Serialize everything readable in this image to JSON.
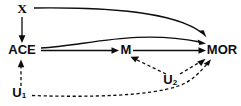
{
  "diagram": {
    "type": "causal-dag",
    "title": "",
    "colors": {
      "background": "#ffffff",
      "ink": "#0d0d0d"
    },
    "nodes": [
      {
        "id": "X",
        "label": "X",
        "subscript": "",
        "x": 22,
        "y": 10,
        "style": "serif-bold"
      },
      {
        "id": "ACE",
        "label": "ACE",
        "subscript": "",
        "x": 22,
        "y": 50,
        "style": "bold"
      },
      {
        "id": "M",
        "label": "M",
        "subscript": "",
        "x": 126,
        "y": 50,
        "style": "bold"
      },
      {
        "id": "MOR",
        "label": "MOR",
        "subscript": "",
        "x": 222,
        "y": 50,
        "style": "bold"
      },
      {
        "id": "U1",
        "label": "U",
        "subscript": "1",
        "x": 20,
        "y": 94,
        "style": "bold"
      },
      {
        "id": "U2",
        "label": "U",
        "subscript": "2",
        "x": 171,
        "y": 81,
        "style": "bold"
      }
    ],
    "edges": [
      {
        "id": "x-to-mor",
        "from": "X",
        "to": "MOR",
        "line": "solid",
        "shape": "curved"
      },
      {
        "id": "x-to-ace",
        "from": "X",
        "to": "ACE",
        "line": "solid",
        "shape": "straight"
      },
      {
        "id": "ace-to-mor",
        "from": "ACE",
        "to": "MOR",
        "line": "solid",
        "shape": "curved"
      },
      {
        "id": "ace-to-m",
        "from": "ACE",
        "to": "M",
        "line": "solid",
        "shape": "straight"
      },
      {
        "id": "m-to-mor",
        "from": "M",
        "to": "MOR",
        "line": "solid",
        "shape": "straight"
      },
      {
        "id": "u2-to-m",
        "from": "U2",
        "to": "M",
        "line": "dashed",
        "shape": "straight"
      },
      {
        "id": "u2-to-mor",
        "from": "U2",
        "to": "MOR",
        "line": "dashed",
        "shape": "straight"
      },
      {
        "id": "u1-to-ace",
        "from": "U1",
        "to": "ACE",
        "line": "dashed",
        "shape": "straight"
      },
      {
        "id": "u1-to-mor",
        "from": "U1",
        "to": "MOR",
        "line": "dashed",
        "shape": "curved"
      }
    ]
  }
}
